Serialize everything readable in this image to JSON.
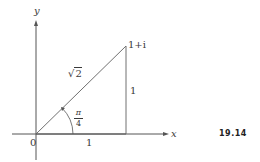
{
  "figure": {
    "number": "19.14",
    "axes": {
      "x_label": "x",
      "y_label": "y",
      "origin_label": "0"
    },
    "point": {
      "label": "1+i"
    },
    "segments": {
      "hypotenuse_label": "√2",
      "hypotenuse_radicand": "2",
      "hypotenuse_radical": "√",
      "base_label": "1",
      "height_label": "1"
    },
    "angle": {
      "numerator": "π",
      "denominator": "4"
    },
    "colors": {
      "line": "#707070",
      "axis": "#555555",
      "text": "#3a3a3a"
    }
  }
}
